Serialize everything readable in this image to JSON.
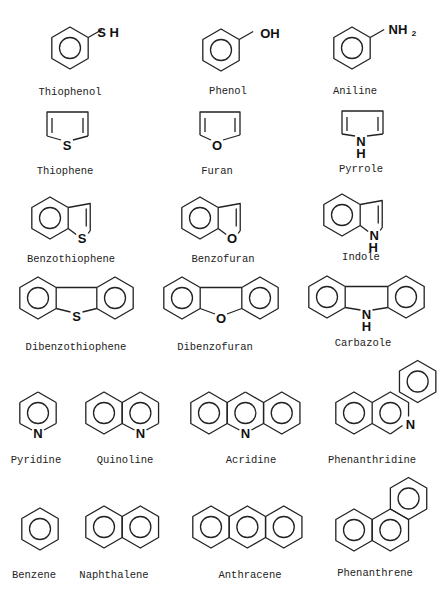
{
  "figure": {
    "type": "chemical-structure-grid",
    "compounds": [
      {
        "name": "Thiophenol",
        "label_x": 70,
        "label_y": 95,
        "substituent": "SH"
      },
      {
        "name": "Phenol",
        "label_x": 228,
        "label_y": 94,
        "substituent": "OH"
      },
      {
        "name": "Aniline",
        "label_x": 355,
        "label_y": 94,
        "substituent": "NH2"
      },
      {
        "name": "Thiophene",
        "label_x": 65,
        "label_y": 174,
        "heteroatom": "S"
      },
      {
        "name": "Furan",
        "label_x": 217,
        "label_y": 174,
        "heteroatom": "O"
      },
      {
        "name": "Pyrrole",
        "label_x": 361,
        "label_y": 172,
        "heteroatom": "NH"
      },
      {
        "name": "Benzothiophene",
        "label_x": 71,
        "label_y": 262,
        "heteroatom": "S"
      },
      {
        "name": "Benzofuran",
        "label_x": 223,
        "label_y": 262,
        "heteroatom": "O"
      },
      {
        "name": "Indole",
        "label_x": 361,
        "label_y": 260,
        "heteroatom": "NH"
      },
      {
        "name": "Dibenzothiophene",
        "label_x": 76,
        "label_y": 350,
        "heteroatom": "S"
      },
      {
        "name": "Dibenzofuran",
        "label_x": 215,
        "label_y": 350,
        "heteroatom": "O"
      },
      {
        "name": "Carbazole",
        "label_x": 363,
        "label_y": 346,
        "heteroatom": "NH"
      },
      {
        "name": "Pyridine",
        "label_x": 36,
        "label_y": 463,
        "heteroatom": "N"
      },
      {
        "name": "Quinoline",
        "label_x": 125,
        "label_y": 463,
        "heteroatom": "N"
      },
      {
        "name": "Acridine",
        "label_x": 251,
        "label_y": 463,
        "heteroatom": "N"
      },
      {
        "name": "Phenanthridine",
        "label_x": 372,
        "label_y": 463,
        "heteroatom": "N"
      },
      {
        "name": "Benzene",
        "label_x": 34,
        "label_y": 578
      },
      {
        "name": "Naphthalene",
        "label_x": 114,
        "label_y": 578
      },
      {
        "name": "Anthracene",
        "label_x": 250,
        "label_y": 578
      },
      {
        "name": "Phenanthrene",
        "label_x": 375,
        "label_y": 576
      }
    ],
    "atom_labels": {
      "S": "S",
      "O": "O",
      "N": "N",
      "H": "H",
      "SH": "S H",
      "OH": "OH",
      "NH": "NH",
      "sub2": "2"
    }
  }
}
